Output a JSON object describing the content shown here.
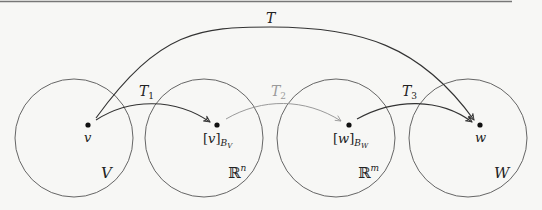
{
  "diagram": {
    "colors": {
      "background": "#f7f7f5",
      "stroke": "#333333",
      "circle_stroke": "#555555",
      "faded_arrow": "#9a9a9a",
      "faded_label": "#9a9a9a",
      "top_rule": "#777777"
    },
    "sets": [
      {
        "id": "V",
        "label": "V",
        "cx": 74,
        "cy": 138,
        "r": 59
      },
      {
        "id": "Rn",
        "label": "ℝ",
        "sup": "n",
        "cx": 204,
        "cy": 138,
        "r": 59
      },
      {
        "id": "Rm",
        "label": "ℝ",
        "sup": "m",
        "cx": 336,
        "cy": 138,
        "r": 59
      },
      {
        "id": "W",
        "label": "W",
        "cx": 468,
        "cy": 138,
        "r": 59
      }
    ],
    "points": [
      {
        "id": "v",
        "label": "v",
        "sub": "",
        "x": 88,
        "y": 125
      },
      {
        "id": "vB",
        "label": "[v]",
        "sub": "B",
        "subsub": "V",
        "x": 217,
        "y": 125
      },
      {
        "id": "wB",
        "label": "[w]",
        "sub": "B",
        "subsub": "W",
        "x": 349,
        "y": 125
      },
      {
        "id": "w",
        "label": "w",
        "sub": "",
        "x": 480,
        "y": 125
      }
    ],
    "arrows": [
      {
        "id": "T",
        "label": "T",
        "from": "v",
        "to": "w",
        "style": "solid"
      },
      {
        "id": "T1",
        "label": "T",
        "sub": "1",
        "from": "v",
        "to": "vB",
        "style": "solid"
      },
      {
        "id": "T2",
        "label": "T",
        "sub": "2",
        "from": "vB",
        "to": "wB",
        "style": "faded"
      },
      {
        "id": "T3",
        "label": "T",
        "sub": "3",
        "from": "wB",
        "to": "w",
        "style": "solid"
      }
    ]
  }
}
